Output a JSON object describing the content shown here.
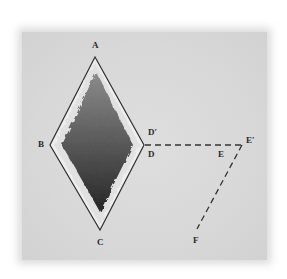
{
  "diagram": {
    "type": "geometry-rhombus-with-dashed-lines",
    "colors": {
      "panel_background": "#d9d9d9",
      "outline": "#333333",
      "border_fill": "#f2f2f2",
      "inner_fill_top": "#8a8a8a",
      "inner_fill_bottom": "#2e2e2e",
      "dashed_line": "#333333"
    },
    "labels": {
      "A": "A",
      "B": "B",
      "C": "C",
      "D": "D",
      "D_prime": "D′",
      "E": "E",
      "E_prime": "E′",
      "F": "F"
    },
    "points": {
      "A": [
        95,
        57
      ],
      "B": [
        50,
        145
      ],
      "C": [
        100,
        230
      ],
      "D": [
        144,
        145
      ],
      "E_prime": [
        242,
        145
      ],
      "F": [
        197,
        229
      ]
    },
    "segments": [
      {
        "from": "D",
        "to": "E′",
        "style": "dashed"
      },
      {
        "from": "E′",
        "to": "F",
        "style": "dashed"
      }
    ]
  }
}
